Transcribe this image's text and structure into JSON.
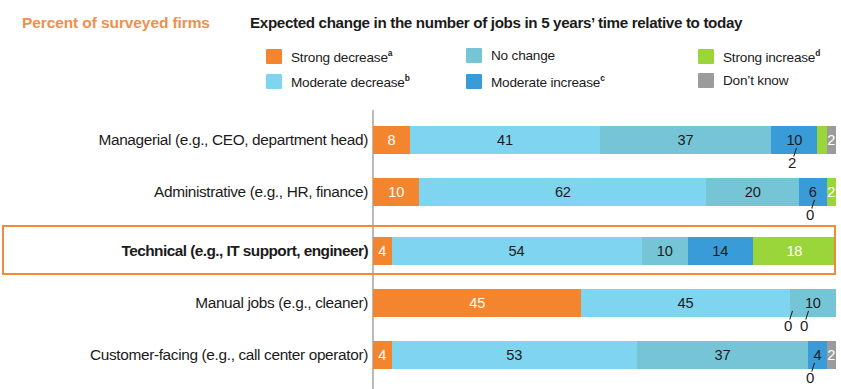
{
  "header": {
    "unit_label": "Percent of surveyed firms",
    "legend_title": "Expected change in the number of jobs in 5 years’ time relative to today"
  },
  "legend": [
    {
      "label": "Strong decrease",
      "sup": "a",
      "color": "#f2852e",
      "col": 0,
      "row": 0,
      "name": "strong-decrease"
    },
    {
      "label": "Moderate decrease",
      "sup": "b",
      "color": "#7fd4ef",
      "col": 0,
      "row": 1,
      "name": "moderate-decrease"
    },
    {
      "label": "No change",
      "sup": "",
      "color": "#76c5d7",
      "col": 1,
      "row": 0,
      "name": "no-change"
    },
    {
      "label": "Moderate increase",
      "sup": "c",
      "color": "#3a9bd9",
      "col": 1,
      "row": 1,
      "name": "moderate-increase"
    },
    {
      "label": "Strong increase",
      "sup": "d",
      "color": "#9ad63a",
      "col": 2,
      "row": 0,
      "name": "strong-increase"
    },
    {
      "label": "Don’t know",
      "sup": "",
      "color": "#9b9b9b",
      "col": 2,
      "row": 1,
      "name": "dont-know"
    }
  ],
  "chart_data": {
    "type": "bar",
    "subtype": "stacked-horizontal-100",
    "title": "Expected change in the number of jobs in 5 years’ time relative to today",
    "xlabel": "Percent of surveyed firms",
    "ylabel": "",
    "xlim": [
      0,
      100
    ],
    "grid": false,
    "legend_position": "top",
    "categories": [
      "Managerial (e.g., CEO, department head)",
      "Administrative (e.g., HR, finance)",
      "Technical (e.g., IT support, engineer)",
      "Manual jobs (e.g., cleaner)",
      "Customer-facing (e.g., call center operator)"
    ],
    "series": [
      {
        "name": "Strong decrease",
        "color": "#f2852e",
        "values": [
          8,
          10,
          4,
          45,
          4
        ]
      },
      {
        "name": "Moderate decrease",
        "color": "#7fd4ef",
        "values": [
          41,
          62,
          54,
          45,
          53
        ]
      },
      {
        "name": "No change",
        "color": "#76c5d7",
        "values": [
          37,
          20,
          10,
          10,
          37
        ]
      },
      {
        "name": "Moderate increase",
        "color": "#3a9bd9",
        "values": [
          10,
          6,
          14,
          0,
          4
        ]
      },
      {
        "name": "Strong increase",
        "color": "#9ad63a",
        "values": [
          2,
          2,
          18,
          0,
          0
        ]
      },
      {
        "name": "Don’t know",
        "color": "#9b9b9b",
        "values": [
          2,
          0,
          0,
          0,
          2
        ]
      }
    ]
  },
  "rows": [
    {
      "label": "Managerial (e.g., CEO, department head)",
      "highlight": false,
      "segments": [
        {
          "value": "8",
          "pct": 8,
          "color": "#f2852e",
          "text": "#ffffff",
          "name": "strong-decrease",
          "inline": true
        },
        {
          "value": "41",
          "pct": 41,
          "color": "#7fd4ef",
          "text": "#1b1b1b",
          "name": "moderate-decrease",
          "inline": true
        },
        {
          "value": "37",
          "pct": 37,
          "color": "#76c5d7",
          "text": "#1b1b1b",
          "name": "no-change",
          "inline": true
        },
        {
          "value": "10",
          "pct": 10,
          "color": "#3a9bd9",
          "text": "#1b1b1b",
          "name": "moderate-increase",
          "inline": true
        },
        {
          "value": "2",
          "pct": 2,
          "color": "#9ad63a",
          "text": "#1b1b1b",
          "name": "strong-increase",
          "inline": false
        },
        {
          "value": "2",
          "pct": 2,
          "color": "#9b9b9b",
          "text": "#ffffff",
          "name": "dont-know",
          "inline": true
        }
      ],
      "callouts": [
        {
          "value": "2",
          "left": 788,
          "top": 40,
          "name": "strong-increase-callout"
        }
      ]
    },
    {
      "label": "Administrative (e.g., HR, finance)",
      "highlight": false,
      "segments": [
        {
          "value": "10",
          "pct": 10,
          "color": "#f2852e",
          "text": "#ffffff",
          "name": "strong-decrease",
          "inline": true
        },
        {
          "value": "62",
          "pct": 62,
          "color": "#7fd4ef",
          "text": "#1b1b1b",
          "name": "moderate-decrease",
          "inline": true
        },
        {
          "value": "20",
          "pct": 20,
          "color": "#76c5d7",
          "text": "#1b1b1b",
          "name": "no-change",
          "inline": true
        },
        {
          "value": "6",
          "pct": 6,
          "color": "#3a9bd9",
          "text": "#1b1b1b",
          "name": "moderate-increase",
          "inline": true
        },
        {
          "value": "2",
          "pct": 2,
          "color": "#9ad63a",
          "text": "#ffffff",
          "name": "strong-increase",
          "inline": true
        },
        {
          "value": "0",
          "pct": 0,
          "color": "#9b9b9b",
          "text": "#ffffff",
          "name": "dont-know",
          "inline": false
        }
      ],
      "callouts": [
        {
          "value": "0",
          "left": 806,
          "top": 40,
          "name": "dont-know-callout"
        }
      ]
    },
    {
      "label": "Technical (e.g., IT support, engineer)",
      "highlight": true,
      "segments": [
        {
          "value": "4",
          "pct": 4,
          "color": "#f2852e",
          "text": "#ffffff",
          "name": "strong-decrease",
          "inline": true
        },
        {
          "value": "54",
          "pct": 54,
          "color": "#7fd4ef",
          "text": "#1b1b1b",
          "name": "moderate-decrease",
          "inline": true
        },
        {
          "value": "10",
          "pct": 10,
          "color": "#76c5d7",
          "text": "#1b1b1b",
          "name": "no-change",
          "inline": true
        },
        {
          "value": "14",
          "pct": 14,
          "color": "#3a9bd9",
          "text": "#1b1b1b",
          "name": "moderate-increase",
          "inline": true
        },
        {
          "value": "18",
          "pct": 18,
          "color": "#9ad63a",
          "text": "#ffffff",
          "name": "strong-increase",
          "inline": true
        },
        {
          "value": "0",
          "pct": 0,
          "color": "#9b9b9b",
          "text": "#ffffff",
          "name": "dont-know",
          "inline": true
        }
      ],
      "callouts": []
    },
    {
      "label": "Manual jobs (e.g., cleaner)",
      "highlight": false,
      "segments": [
        {
          "value": "45",
          "pct": 45,
          "color": "#f2852e",
          "text": "#ffffff",
          "name": "strong-decrease",
          "inline": true
        },
        {
          "value": "45",
          "pct": 45,
          "color": "#7fd4ef",
          "text": "#1b1b1b",
          "name": "moderate-decrease",
          "inline": true
        },
        {
          "value": "10",
          "pct": 10,
          "color": "#76c5d7",
          "text": "#1b1b1b",
          "name": "no-change",
          "inline": true
        },
        {
          "value": "0",
          "pct": 0,
          "color": "#3a9bd9",
          "text": "#1b1b1b",
          "name": "moderate-increase",
          "inline": false
        },
        {
          "value": "0",
          "pct": 0,
          "color": "#9ad63a",
          "text": "#1b1b1b",
          "name": "strong-increase",
          "inline": false
        },
        {
          "value": "0",
          "pct": 0,
          "color": "#9b9b9b",
          "text": "#ffffff",
          "name": "dont-know",
          "inline": true
        }
      ],
      "callouts": [
        {
          "value": "0",
          "left": 784,
          "top": 40,
          "name": "moderate-increase-callout"
        },
        {
          "value": "0",
          "left": 800,
          "top": 40,
          "name": "strong-increase-callout"
        }
      ]
    },
    {
      "label": "Customer-facing (e.g., call center operator)",
      "highlight": false,
      "segments": [
        {
          "value": "4",
          "pct": 4,
          "color": "#f2852e",
          "text": "#ffffff",
          "name": "strong-decrease",
          "inline": true
        },
        {
          "value": "53",
          "pct": 53,
          "color": "#7fd4ef",
          "text": "#1b1b1b",
          "name": "moderate-decrease",
          "inline": true
        },
        {
          "value": "37",
          "pct": 37,
          "color": "#76c5d7",
          "text": "#1b1b1b",
          "name": "no-change",
          "inline": true
        },
        {
          "value": "4",
          "pct": 4,
          "color": "#3a9bd9",
          "text": "#1b1b1b",
          "name": "moderate-increase",
          "inline": true
        },
        {
          "value": "0",
          "pct": 0,
          "color": "#9ad63a",
          "text": "#1b1b1b",
          "name": "strong-increase",
          "inline": false
        },
        {
          "value": "2",
          "pct": 2,
          "color": "#9b9b9b",
          "text": "#ffffff",
          "name": "dont-know",
          "inline": true
        }
      ],
      "callouts": [
        {
          "value": "0",
          "left": 806,
          "top": 40,
          "name": "strong-increase-callout"
        }
      ]
    }
  ],
  "layout": {
    "axis_x": 372,
    "bar_start_x": 373,
    "scale_px_per_pct": 4.63,
    "row_height": 52,
    "row_tops": [
      8,
      60,
      119,
      171,
      223
    ]
  }
}
